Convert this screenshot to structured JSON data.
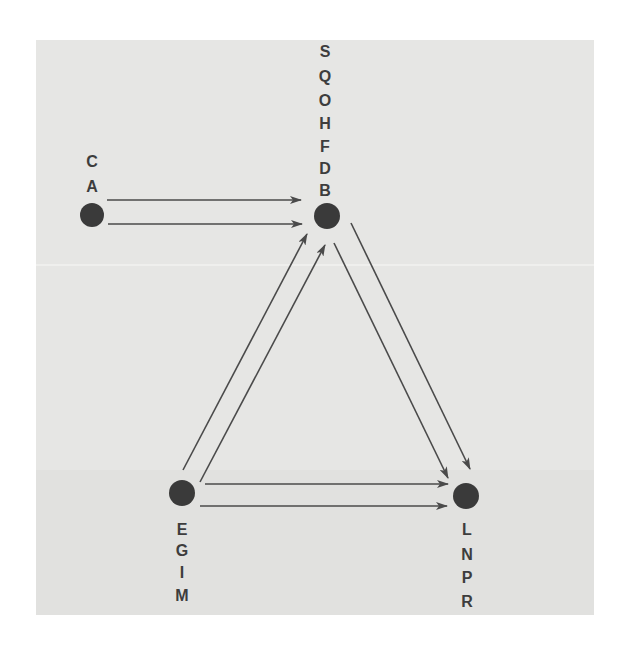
{
  "diagram": {
    "colors": {
      "background": "#e6e6e4",
      "node": "#3a3a3a",
      "edge": "#4a4a4a",
      "label": "#3d3d3d"
    },
    "nodes": [
      {
        "id": "A",
        "x": 92,
        "y": 215,
        "r": 12,
        "labels": [
          "C",
          "A"
        ],
        "label_position": "above"
      },
      {
        "id": "B",
        "x": 327,
        "y": 216,
        "r": 13,
        "labels": [
          "S",
          "Q",
          "O",
          "H",
          "F",
          "D",
          "B"
        ],
        "label_position": "above"
      },
      {
        "id": "E",
        "x": 182,
        "y": 493,
        "r": 13,
        "labels": [
          "E",
          "G",
          "I",
          "M"
        ],
        "label_position": "below"
      },
      {
        "id": "L",
        "x": 466,
        "y": 496,
        "r": 13,
        "labels": [
          "L",
          "N",
          "P",
          "R"
        ],
        "label_position": "below"
      }
    ],
    "edges": [
      {
        "from": "A",
        "to": "B",
        "x1": 107,
        "y1": 200,
        "x2": 301,
        "y2": 200
      },
      {
        "from": "A",
        "to": "B",
        "x1": 108,
        "y1": 224,
        "x2": 302,
        "y2": 224
      },
      {
        "from": "E",
        "to": "B",
        "x1": 183,
        "y1": 470,
        "x2": 307,
        "y2": 234
      },
      {
        "from": "E",
        "to": "B",
        "x1": 200,
        "y1": 482,
        "x2": 325,
        "y2": 245
      },
      {
        "from": "B",
        "to": "L",
        "x1": 334,
        "y1": 243,
        "x2": 448,
        "y2": 478
      },
      {
        "from": "B",
        "to": "L",
        "x1": 351,
        "y1": 223,
        "x2": 470,
        "y2": 469
      },
      {
        "from": "E",
        "to": "L",
        "x1": 205,
        "y1": 484,
        "x2": 448,
        "y2": 484
      },
      {
        "from": "E",
        "to": "L",
        "x1": 200,
        "y1": 506,
        "x2": 447,
        "y2": 506
      }
    ],
    "labels": [
      {
        "text": "C",
        "x": 92,
        "y": 162
      },
      {
        "text": "A",
        "x": 92,
        "y": 187
      },
      {
        "text": "S",
        "x": 325,
        "y": 52
      },
      {
        "text": "Q",
        "x": 325,
        "y": 77
      },
      {
        "text": "O",
        "x": 325,
        "y": 101
      },
      {
        "text": "H",
        "x": 325,
        "y": 124
      },
      {
        "text": "F",
        "x": 325,
        "y": 147
      },
      {
        "text": "D",
        "x": 325,
        "y": 169
      },
      {
        "text": "B",
        "x": 325,
        "y": 191
      },
      {
        "text": "E",
        "x": 182,
        "y": 530
      },
      {
        "text": "G",
        "x": 182,
        "y": 551
      },
      {
        "text": "I",
        "x": 182,
        "y": 573
      },
      {
        "text": "M",
        "x": 182,
        "y": 596
      },
      {
        "text": "L",
        "x": 467,
        "y": 530
      },
      {
        "text": "N",
        "x": 467,
        "y": 555
      },
      {
        "text": "P",
        "x": 467,
        "y": 578
      },
      {
        "text": "R",
        "x": 467,
        "y": 602
      }
    ]
  }
}
